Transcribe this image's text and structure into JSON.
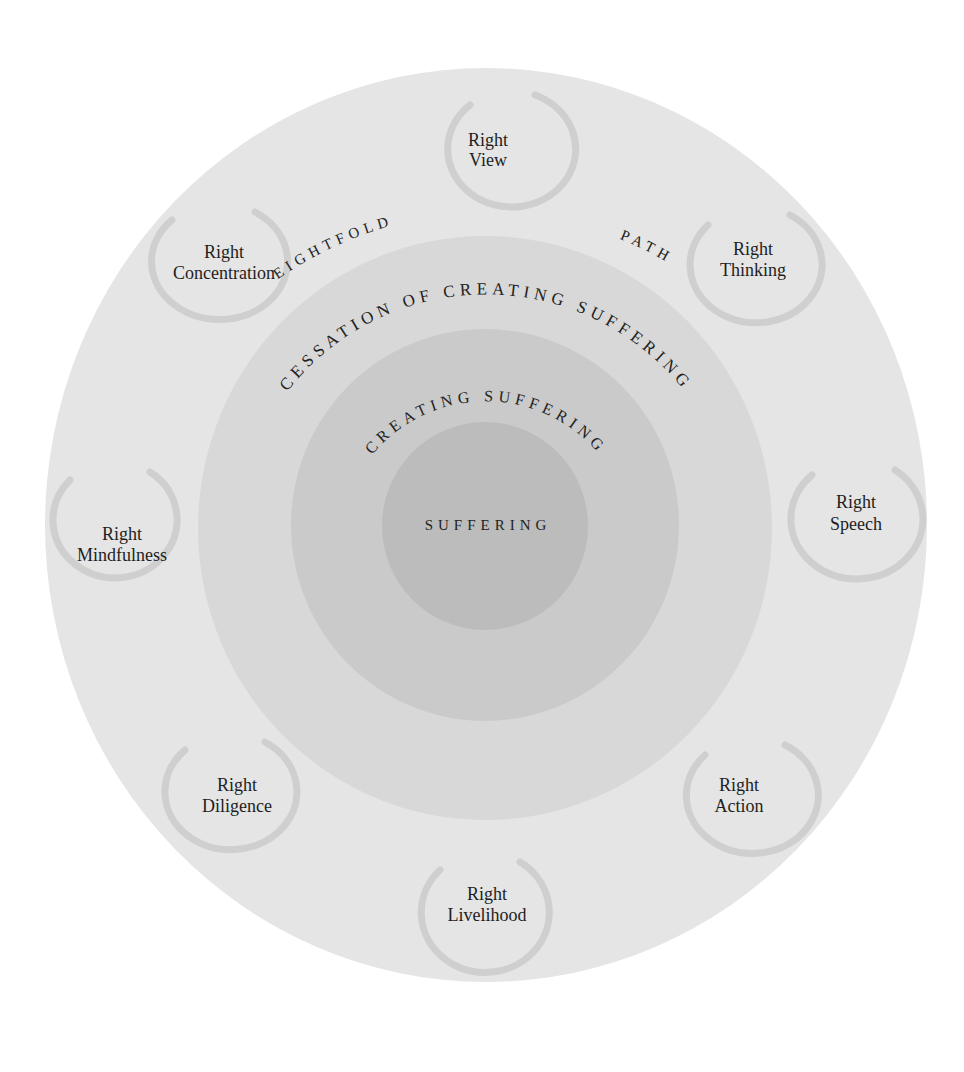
{
  "diagram": {
    "title_arc": {
      "left": "EIGHTFOLD",
      "right": "PATH"
    },
    "rings": [
      {
        "name": "outer",
        "label": "",
        "color": "#e5e5e5"
      },
      {
        "name": "cessation",
        "label": "CESSATION OF CREATING SUFFERING",
        "color": "#d8d8d8"
      },
      {
        "name": "creating",
        "label": "CREATING SUFFERING",
        "color": "#cacaca"
      },
      {
        "name": "center",
        "label": "SUFFERING",
        "color": "#bcbcbc"
      }
    ],
    "path_items": [
      {
        "line1": "Right",
        "line2": "View"
      },
      {
        "line1": "Right",
        "line2": "Thinking"
      },
      {
        "line1": "Right",
        "line2": "Speech"
      },
      {
        "line1": "Right",
        "line2": "Action"
      },
      {
        "line1": "Right",
        "line2": "Livelihood"
      },
      {
        "line1": "Right",
        "line2": "Diligence"
      },
      {
        "line1": "Right",
        "line2": "Mindfulness"
      },
      {
        "line1": "Right",
        "line2": "Concentration"
      }
    ],
    "enso_color": "#cfcfcf",
    "text_color": "#1e1e1e"
  }
}
